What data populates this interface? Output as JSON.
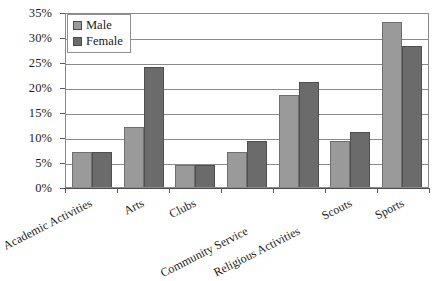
{
  "chart_data": {
    "type": "bar",
    "title": "",
    "subtitle": "",
    "xlabel": "",
    "ylabel": "",
    "categories": [
      "Academic Activities",
      "Arts",
      "Clubs",
      "Community Service",
      "Religious Activities",
      "Scouts",
      "Sports"
    ],
    "series": [
      {
        "name": "Male",
        "color": "#9a9a9a",
        "values": [
          7,
          12,
          4.5,
          7,
          18.5,
          9.3,
          33
        ]
      },
      {
        "name": "Female",
        "color": "#6b6b6b",
        "values": [
          7,
          24,
          4.5,
          9.3,
          21,
          11,
          28.3
        ]
      }
    ],
    "ylim": [
      0,
      35
    ],
    "ytick_step": 5,
    "ytick_labels": [
      "0%",
      "5%",
      "10%",
      "15%",
      "20%",
      "25%",
      "30%",
      "35%"
    ],
    "grid": true,
    "legend_position": "top-left",
    "units": "percent"
  },
  "legend": {
    "items": [
      {
        "label": "Male"
      },
      {
        "label": "Female"
      }
    ]
  }
}
